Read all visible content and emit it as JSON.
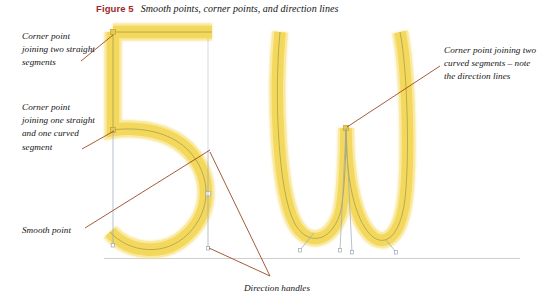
{
  "figure": {
    "label": "Figure 5",
    "caption": "Smooth points, corner points, and direction lines"
  },
  "annotations": {
    "corner_two_straight": "Corner point joining two straight segments",
    "corner_one_straight_one_curved": "Corner point joining one straight and one curved segment",
    "smooth_point": "Smooth point",
    "corner_two_curved": "Corner point joining two curved segments – note the direction lines",
    "direction_handles": "Direction handles"
  },
  "glyphs": {
    "digit": "5",
    "letter": "w"
  },
  "colors": {
    "stroke_yellow": "#F3D85B",
    "stroke_yellow_soft": "#F7E27E",
    "path_line": "#8C8C50",
    "leader_line": "#9B4A22",
    "handle_line": "#9AA8B8",
    "baseline": "#CFCFCF",
    "figure_label": "#9E2A2B",
    "text": "#151515",
    "background": "#FFFFFF"
  }
}
